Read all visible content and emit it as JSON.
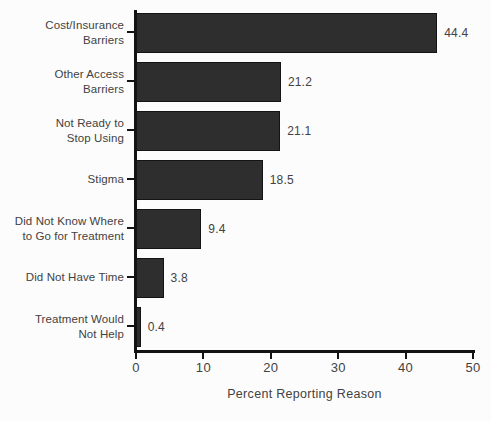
{
  "chart_data": {
    "type": "bar",
    "orientation": "horizontal",
    "title": "",
    "xlabel": "Percent Reporting Reason",
    "ylabel": "",
    "xlim": [
      0,
      50
    ],
    "grid": false,
    "legend": "none",
    "categories": [
      "Cost/Insurance Barriers",
      "Other Access Barriers",
      "Not Ready to Stop Using",
      "Stigma",
      "Did Not Know Where to Go for Treatment",
      "Did Not Have Time",
      "Treatment Would Not Help"
    ],
    "category_lines": [
      [
        "Cost/Insurance",
        "Barriers"
      ],
      [
        "Other Access",
        "Barriers"
      ],
      [
        "Not Ready to",
        "Stop Using"
      ],
      [
        "Stigma"
      ],
      [
        "Did Not Know Where",
        "to Go for Treatment"
      ],
      [
        "Did Not Have Time"
      ],
      [
        "Treatment Would",
        "Not Help"
      ]
    ],
    "values": [
      44.4,
      21.2,
      21.1,
      18.5,
      9.4,
      3.8,
      0.4
    ],
    "value_labels": [
      "44.4",
      "21.2",
      "21.1",
      "18.5",
      "9.4",
      "3.8",
      "0.4"
    ],
    "x_ticks": [
      0,
      10,
      20,
      30,
      40,
      50
    ],
    "x_tick_labels": [
      "0",
      "10",
      "20",
      "30",
      "40",
      "50"
    ],
    "colors": {
      "bar": "#2e2e2e",
      "bar_border": "#141414",
      "axis": "#131313",
      "text": "#424242",
      "background": "#fcfcfc"
    }
  }
}
